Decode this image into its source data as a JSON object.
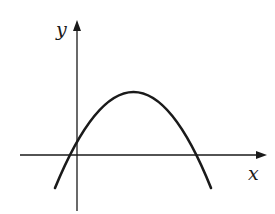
{
  "diagram": {
    "type": "function-graph",
    "axes": {
      "x_label": "x",
      "y_label": "y"
    },
    "curve": {
      "shape": "parabola",
      "opens": "down",
      "vertex_position": "first quadrant",
      "roots": [
        "negative",
        "positive"
      ],
      "y_intercept": "positive"
    },
    "colors": {
      "stroke": "#1a1a1a",
      "background": "#ffffff"
    }
  }
}
